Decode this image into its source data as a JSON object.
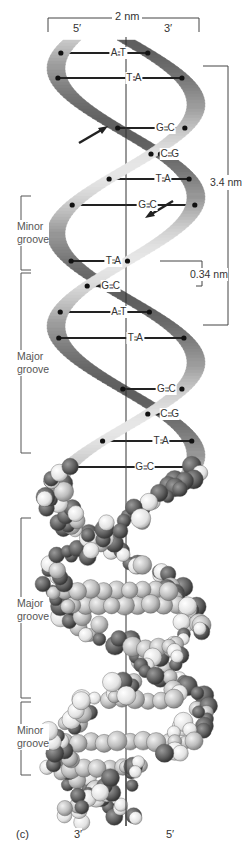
{
  "figure": {
    "panel_label": "(c)",
    "width_label": "2 nm",
    "top_strand_ends": {
      "left": "5′",
      "right": "3′"
    },
    "bottom_strand_ends": {
      "left": "3′",
      "right": "5′"
    },
    "pitch_label": "3.4 nm",
    "rise_label": "0.34 nm",
    "colors": {
      "ribbon_light": "#d6d6d6",
      "ribbon_mid": "#a9a9a9",
      "ribbon_dark": "#4a4a4a",
      "bond": "#222222",
      "axis": "#333333",
      "atom_light": "#c8c8c8",
      "atom_dark": "#5a5a5a"
    }
  },
  "ribbon_model": {
    "base_pairs": [
      {
        "left": "A",
        "right": "T",
        "bonds": "double"
      },
      {
        "left": "T",
        "right": "A",
        "bonds": "double"
      },
      {
        "left": "G",
        "right": "C",
        "bonds": "triple"
      },
      {
        "left": "C",
        "right": "G",
        "bonds": "triple"
      },
      {
        "left": "T",
        "right": "A",
        "bonds": "double"
      },
      {
        "left": "G",
        "right": "C",
        "bonds": "triple"
      },
      {
        "left": "T",
        "right": "A",
        "bonds": "double"
      },
      {
        "left": "G",
        "right": "C",
        "bonds": "triple"
      },
      {
        "left": "A",
        "right": "T",
        "bonds": "double"
      },
      {
        "left": "T",
        "right": "A",
        "bonds": "double"
      },
      {
        "left": "G",
        "right": "C",
        "bonds": "triple"
      },
      {
        "left": "C",
        "right": "G",
        "bonds": "triple"
      },
      {
        "left": "T",
        "right": "A",
        "bonds": "double"
      },
      {
        "left": "G",
        "right": "C",
        "bonds": "triple"
      }
    ],
    "groove_labels": [
      {
        "line1": "Minor",
        "line2": "groove"
      },
      {
        "line1": "Major",
        "line2": "groove"
      }
    ],
    "strand_direction_arrows": [
      "up-right",
      "down-left"
    ]
  },
  "space_filling_model": {
    "groove_labels": [
      {
        "line1": "Major",
        "line2": "groove"
      },
      {
        "line1": "Minor",
        "line2": "groove"
      }
    ]
  }
}
